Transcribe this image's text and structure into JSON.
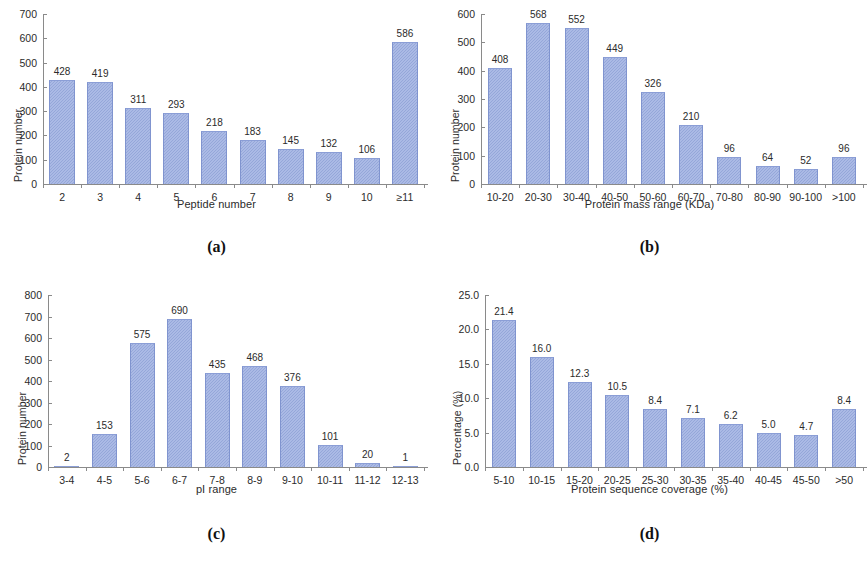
{
  "figure": {
    "bar_color": "#9aace0",
    "axis_color": "#8a8a8a",
    "text_color": "#2b2b2b"
  },
  "panels": [
    {
      "tag": "(a)",
      "chart_data": {
        "type": "bar",
        "title": "",
        "xlabel": "Peptide number",
        "ylabel": "Protein number",
        "categories": [
          "2",
          "3",
          "4",
          "5",
          "6",
          "7",
          "8",
          "9",
          "10",
          "≥11"
        ],
        "values": [
          428,
          419,
          311,
          293,
          218,
          183,
          145,
          132,
          106,
          586
        ],
        "value_labels": [
          "428",
          "419",
          "311",
          "293",
          "218",
          "183",
          "145",
          "132",
          "106",
          "586"
        ],
        "ylim": [
          0,
          700
        ],
        "yticks": [
          0,
          100,
          200,
          300,
          400,
          500,
          600,
          700
        ],
        "ytick_labels": [
          "0",
          "100",
          "200",
          "300",
          "400",
          "500",
          "600",
          "700"
        ],
        "grid": false,
        "legend": "none"
      }
    },
    {
      "tag": "(b)",
      "chart_data": {
        "type": "bar",
        "title": "",
        "xlabel": "Protein mass range (KDa)",
        "ylabel": "Protein number",
        "categories": [
          "10-20",
          "20-30",
          "30-40",
          "40-50",
          "50-60",
          "60-70",
          "70-80",
          "80-90",
          "90-100",
          ">100"
        ],
        "values": [
          408,
          568,
          552,
          449,
          326,
          210,
          96,
          64,
          52,
          96
        ],
        "value_labels": [
          "408",
          "568",
          "552",
          "449",
          "326",
          "210",
          "96",
          "64",
          "52",
          "96"
        ],
        "ylim": [
          0,
          600
        ],
        "yticks": [
          0,
          100,
          200,
          300,
          400,
          500,
          600
        ],
        "ytick_labels": [
          "0",
          "100",
          "200",
          "300",
          "400",
          "500",
          "600"
        ],
        "grid": false,
        "legend": "none"
      }
    },
    {
      "tag": "(c)",
      "chart_data": {
        "type": "bar",
        "title": "",
        "xlabel": "pI range",
        "ylabel": "Protein number",
        "categories": [
          "3-4",
          "4-5",
          "5-6",
          "6-7",
          "7-8",
          "8-9",
          "9-10",
          "10-11",
          "11-12",
          "12-13"
        ],
        "values": [
          2,
          153,
          575,
          690,
          435,
          468,
          376,
          101,
          20,
          1
        ],
        "value_labels": [
          "2",
          "153",
          "575",
          "690",
          "435",
          "468",
          "376",
          "101",
          "20",
          "1"
        ],
        "ylim": [
          0,
          800
        ],
        "yticks": [
          0,
          100,
          200,
          300,
          400,
          500,
          600,
          700,
          800
        ],
        "ytick_labels": [
          "0",
          "100",
          "200",
          "300",
          "400",
          "500",
          "600",
          "700",
          "800"
        ],
        "grid": false,
        "legend": "none"
      }
    },
    {
      "tag": "(d)",
      "chart_data": {
        "type": "bar",
        "title": "",
        "xlabel": "Protein sequence coverage (%)",
        "ylabel": "Percentage (%)",
        "categories": [
          "5-10",
          "10-15",
          "15-20",
          "20-25",
          "25-30",
          "30-35",
          "35-40",
          "40-45",
          "45-50",
          ">50"
        ],
        "values": [
          21.4,
          16.0,
          12.3,
          10.5,
          8.4,
          7.1,
          6.2,
          5.0,
          4.7,
          8.4
        ],
        "value_labels": [
          "21.4",
          "16.0",
          "12.3",
          "10.5",
          "8.4",
          "7.1",
          "6.2",
          "5.0",
          "4.7",
          "8.4"
        ],
        "ylim": [
          0,
          25
        ],
        "yticks": [
          0,
          5,
          10,
          15,
          20,
          25
        ],
        "ytick_labels": [
          "0.0",
          "5.0",
          "10.0",
          "15.0",
          "20.0",
          "25.0"
        ],
        "grid": false,
        "legend": "none"
      }
    }
  ]
}
